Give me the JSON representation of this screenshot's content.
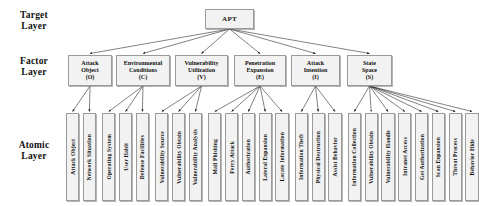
{
  "diagram": {
    "type": "hierarchy-tree",
    "layers": [
      {
        "id": "target",
        "label": "Target\nLayer"
      },
      {
        "id": "factor",
        "label": "Factor\nLayer"
      },
      {
        "id": "atomic",
        "label": "Atomic\nLayer"
      }
    ],
    "root": {
      "id": "apt",
      "label": "APT"
    },
    "factors": [
      {
        "id": "attack-object",
        "name": "Attack\nObject",
        "code": "(O)"
      },
      {
        "id": "environmental-conditions",
        "name": "Environmental\nConditions",
        "code": "(C)"
      },
      {
        "id": "vulnerability-utilization",
        "name": "Vulnerability\nUtilization",
        "code": "(V)"
      },
      {
        "id": "penetration-expansion",
        "name": "Penetration\nExpansion",
        "code": "(E)"
      },
      {
        "id": "attack-intention",
        "name": "Attack\nIntention",
        "code": "(I)"
      },
      {
        "id": "state-space",
        "name": "State\nSpace",
        "code": "(S)"
      }
    ],
    "atomics": [
      {
        "id": "attack-object-a",
        "label": "Attack  Object",
        "parent": "attack-object"
      },
      {
        "id": "network-situation",
        "label": "Network Situation",
        "parent": "attack-object"
      },
      {
        "id": "operating-system",
        "label": "Operating System",
        "parent": "environmental-conditions"
      },
      {
        "id": "user-habit",
        "label": "User Habit",
        "parent": "environmental-conditions"
      },
      {
        "id": "defense-facilities",
        "label": "Defense Facilities",
        "parent": "environmental-conditions"
      },
      {
        "id": "vulnerability-source",
        "label": "Vulnerability Source",
        "parent": "vulnerability-utilization"
      },
      {
        "id": "vulnerability-obtain-1",
        "label": "Vulnerability Obtain",
        "parent": "vulnerability-utilization"
      },
      {
        "id": "vulnerability-analysis",
        "label": "Vulnerability Analysis",
        "parent": "vulnerability-utilization"
      },
      {
        "id": "mail-phishing",
        "label": "Mail Phishing",
        "parent": "penetration-expansion"
      },
      {
        "id": "ferry-attack",
        "label": "Ferry Attack",
        "parent": "penetration-expansion"
      },
      {
        "id": "authorization",
        "label": "Authorization",
        "parent": "penetration-expansion"
      },
      {
        "id": "lateral-expansion",
        "label": "Lateral Expansion",
        "parent": "penetration-expansion"
      },
      {
        "id": "locate-information",
        "label": "Locate Information",
        "parent": "penetration-expansion"
      },
      {
        "id": "information-theft",
        "label": "Information Theft",
        "parent": "attack-intention"
      },
      {
        "id": "physical-destruction",
        "label": "Physical Destruction",
        "parent": "attack-intention"
      },
      {
        "id": "assist-behavior",
        "label": "Assist Behavior",
        "parent": "attack-intention"
      },
      {
        "id": "information-collection",
        "label": "Information Collection",
        "parent": "state-space"
      },
      {
        "id": "vulnerability-obtain-2",
        "label": "Vulnerability Obtain",
        "parent": "state-space"
      },
      {
        "id": "vulnerability-handle",
        "label": "Vulnerability Handle",
        "parent": "state-space"
      },
      {
        "id": "intranet-access",
        "label": "Intranet Access",
        "parent": "state-space"
      },
      {
        "id": "get-authorization",
        "label": "Get Authorization",
        "parent": "state-space"
      },
      {
        "id": "scan-expansion",
        "label": "Scan Expansion",
        "parent": "state-space"
      },
      {
        "id": "threat-process",
        "label": "Threat Process",
        "parent": "state-space"
      },
      {
        "id": "behavior-hide",
        "label": "Behavior Hide",
        "parent": "state-space"
      }
    ],
    "colors": {
      "box_fill": "#f2f2f2",
      "box_border": "#9a9a9a",
      "line": "#1a1a1a",
      "text": "#111111",
      "background": "#ffffff"
    }
  }
}
